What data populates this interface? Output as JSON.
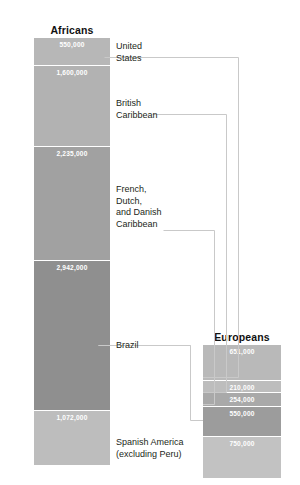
{
  "chart_data": {
    "type": "bar",
    "title": "",
    "subtitle": "",
    "xlabel": "",
    "ylabel": "",
    "grid": false,
    "legend_position": "none",
    "orientation": "vertical-stacked",
    "note": "Two stacked bar columns compare numbers of Africans and Europeans arriving in five American destinations; leader lines link each destination label to its Europeans segment.",
    "columns": [
      {
        "name": "Africans",
        "header": "Africans",
        "total": 8399000,
        "categories": [
          "United States",
          "British Caribbean",
          "French, Dutch, and Danish Caribbean",
          "Brazil",
          "Spanish America (excluding Peru)"
        ],
        "values": [
          550000,
          1600000,
          2235000,
          2942000,
          1072000
        ],
        "value_labels": [
          "550,000",
          "1,600,000",
          "2,235,000",
          "2,942,000",
          "1,072,000"
        ]
      },
      {
        "name": "Europeans",
        "header": "Europeans",
        "total": 2415000,
        "categories": [
          "United States",
          "British Caribbean",
          "French, Dutch, and Danish Caribbean",
          "Brazil",
          "Spanish America (excluding Peru)"
        ],
        "values": [
          651000,
          210000,
          254000,
          550000,
          750000
        ],
        "value_labels": [
          "651,000",
          "210,000",
          "254,000",
          "550,000",
          "750,000"
        ]
      }
    ]
  },
  "headers": {
    "africans": "Africans",
    "europeans": "Europeans"
  },
  "africans_bars": [
    {
      "label": "550,000",
      "value": 550000
    },
    {
      "label": "1,600,000",
      "value": 1600000
    },
    {
      "label": "2,235,000",
      "value": 2235000
    },
    {
      "label": "2,942,000",
      "value": 2942000
    },
    {
      "label": "1,072,000",
      "value": 1072000
    }
  ],
  "europeans_bars": [
    {
      "label": "651,000",
      "value": 651000
    },
    {
      "label": "210,000",
      "value": 210000
    },
    {
      "label": "254,000",
      "value": 254000
    },
    {
      "label": "550,000",
      "value": 550000
    },
    {
      "label": "750,000",
      "value": 750000
    }
  ],
  "category_labels": {
    "united_states": "United\nStates",
    "british_caribbean": "British\nCaribbean",
    "french_dutch_danish_caribbean": "French,\nDutch,\nand Danish\nCaribbean",
    "brazil": "Brazil",
    "spanish_america": "Spanish America\n(excluding Peru)"
  },
  "colors": {
    "background": "#ffffff",
    "text": "#231f20",
    "value_text": "#ffffff",
    "leader_line": "#c9c9c9",
    "africans_band_1": "#b7b7b7",
    "africans_band_2": "#b2b2b2",
    "africans_band_3": "#a1a1a1",
    "africans_band_4": "#8f8f8f",
    "africans_band_5": "#bdbdbd",
    "europeans_band_1": "#b9b9b9",
    "europeans_band_2": "#bdbdbd",
    "europeans_band_3": "#a9a9a9",
    "europeans_band_4": "#9c9c9c",
    "europeans_band_5": "#c2c2c2"
  }
}
